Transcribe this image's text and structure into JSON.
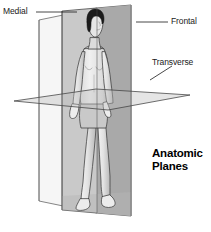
{
  "figure": {
    "title_line1": "Anatomic",
    "title_line2": "Planes",
    "labels": {
      "medial": "Medial",
      "frontal": "Frontal",
      "transverse": "Transverse"
    },
    "colors": {
      "background": "#ffffff",
      "outline": "#3c3c3c",
      "plane_light": "#f4f4f4",
      "plane_mid_light": "#d2d2d2",
      "plane_mid": "#a9a9a9",
      "plane_shadow": "#8f8f8f",
      "skin_light": "#ededed",
      "skin_mid": "#d6d6d6",
      "skin_shade": "#b4b4b4",
      "hair": "#171717",
      "text": "#1a1a1a"
    },
    "planes": [
      {
        "name": "medial",
        "label": "Medial",
        "orientation": "vertical-sagittal",
        "description": "vertical plane dividing body into left and right halves"
      },
      {
        "name": "frontal",
        "label": "Frontal",
        "orientation": "vertical-coronal",
        "description": "vertical plane dividing body into front and back"
      },
      {
        "name": "transverse",
        "label": "Transverse",
        "orientation": "horizontal",
        "description": "horizontal plane dividing body into upper and lower parts"
      }
    ]
  }
}
